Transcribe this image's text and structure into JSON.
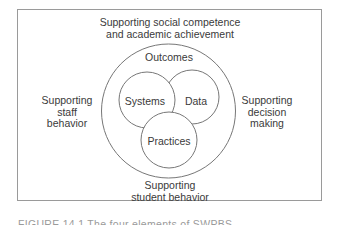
{
  "diagram": {
    "top_label": [
      "Supporting social competence",
      "and academic achievement"
    ],
    "left_label": [
      "Supporting",
      "staff",
      "behavior"
    ],
    "right_label": [
      "Supporting",
      "decision",
      "making"
    ],
    "bottom_label": [
      "Supporting",
      "student behavior"
    ],
    "outer_circle_label": "Outcomes",
    "inner_circles": [
      {
        "label": "Systems"
      },
      {
        "label": "Data"
      },
      {
        "label": "Practices"
      }
    ]
  },
  "caption": "FIGURE 14.1  The four elements of SWPBS"
}
